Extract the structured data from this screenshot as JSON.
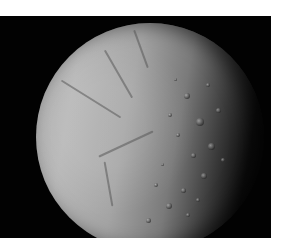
{
  "image": {
    "subject": "Cratered icy moon (gibbous phase) on black space background",
    "colors": {
      "background": "#020202",
      "surface_light": "#b6b6b6",
      "surface_mid": "#7a7a7a",
      "page": "#ffffff"
    },
    "features": {
      "cracks": [
        {
          "x": 20,
          "y": 75,
          "w": 70,
          "rot": 32
        },
        {
          "x": 55,
          "y": 50,
          "w": 55,
          "rot": 60
        },
        {
          "x": 60,
          "y": 120,
          "w": 60,
          "rot": -25
        },
        {
          "x": 85,
          "y": 25,
          "w": 40,
          "rot": 70
        },
        {
          "x": 50,
          "y": 160,
          "w": 45,
          "rot": 80
        }
      ],
      "craters": [
        {
          "x": 148,
          "y": 70,
          "s": 6
        },
        {
          "x": 160,
          "y": 95,
          "s": 8
        },
        {
          "x": 172,
          "y": 120,
          "s": 7
        },
        {
          "x": 155,
          "y": 130,
          "s": 5
        },
        {
          "x": 140,
          "y": 110,
          "s": 4
        },
        {
          "x": 180,
          "y": 85,
          "s": 5
        },
        {
          "x": 132,
          "y": 90,
          "s": 4
        },
        {
          "x": 165,
          "y": 150,
          "s": 6
        },
        {
          "x": 145,
          "y": 165,
          "s": 5
        },
        {
          "x": 130,
          "y": 180,
          "s": 6
        },
        {
          "x": 150,
          "y": 190,
          "s": 4
        },
        {
          "x": 118,
          "y": 160,
          "s": 4
        },
        {
          "x": 185,
          "y": 135,
          "s": 4
        },
        {
          "x": 170,
          "y": 60,
          "s": 4
        },
        {
          "x": 125,
          "y": 140,
          "s": 3
        },
        {
          "x": 110,
          "y": 195,
          "s": 5
        },
        {
          "x": 160,
          "y": 175,
          "s": 4
        },
        {
          "x": 138,
          "y": 55,
          "s": 3
        }
      ]
    }
  }
}
